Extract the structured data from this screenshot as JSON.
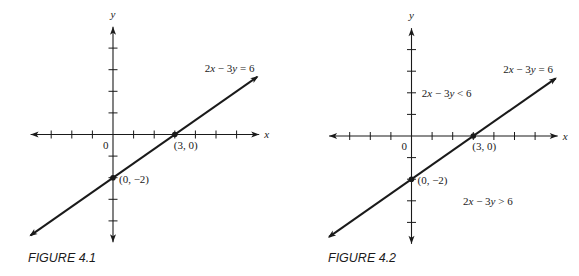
{
  "chart_data": [
    {
      "type": "line",
      "title": "FIGURE 4.1",
      "xlabel": "x",
      "ylabel": "y",
      "origin_label": "0",
      "xlim": [
        -4,
        7
      ],
      "ylim": [
        -4.9,
        4.9
      ],
      "x_ticks": [
        -3,
        -2,
        -1,
        1,
        2,
        3,
        4,
        5,
        6
      ],
      "y_ticks": [
        -4,
        -3,
        -2,
        -1,
        1,
        2,
        3,
        4
      ],
      "grid": false,
      "series": [
        {
          "name": "2x − 3y = 6",
          "x": [
            -4,
            7
          ],
          "y": [
            -4.667,
            2.667
          ],
          "arrows": "both"
        }
      ],
      "points": [
        {
          "x": 3,
          "y": 0,
          "label": "(3, 0)"
        },
        {
          "x": 0,
          "y": -2,
          "label": "(0, −2)"
        }
      ],
      "annotations": [
        {
          "text_main": "2x − 3y = 6",
          "at": [
            4.5,
            3.0
          ]
        }
      ]
    },
    {
      "type": "line",
      "title": "FIGURE 4.2",
      "xlabel": "x",
      "ylabel": "y",
      "origin_label": "0",
      "xlim": [
        -4,
        7
      ],
      "ylim": [
        -4.9,
        4.9
      ],
      "x_ticks": [
        -3,
        -2,
        -1,
        1,
        2,
        3,
        4,
        5,
        6
      ],
      "y_ticks": [
        -4,
        -3,
        -2,
        -1,
        1,
        2,
        3,
        4
      ],
      "grid": false,
      "series": [
        {
          "name": "2x − 3y = 6",
          "x": [
            -4,
            7
          ],
          "y": [
            -4.667,
            2.667
          ],
          "arrows": "both"
        }
      ],
      "points": [
        {
          "x": 3,
          "y": 0,
          "label": "(3, 0)"
        },
        {
          "x": 0,
          "y": -2,
          "label": "(0, −2)"
        }
      ],
      "annotations": [
        {
          "text_main": "2x − 3y = 6",
          "at": [
            4.5,
            3.0
          ]
        },
        {
          "text_main": "2x − 3y < 6",
          "at": [
            0.5,
            1.8
          ]
        },
        {
          "text_main": "2x − 3y > 6",
          "at": [
            2.5,
            -3.2
          ]
        }
      ]
    }
  ]
}
